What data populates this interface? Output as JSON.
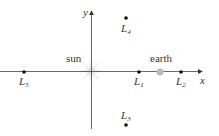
{
  "diagram": {
    "axes": {
      "x_label": "x",
      "y_label": "y"
    },
    "bodies": {
      "sun": {
        "label": "sun",
        "color": "#d8d8d8"
      },
      "earth": {
        "label": "earth",
        "color": "#b8b8b8"
      }
    },
    "points": [
      {
        "id": "L1",
        "base": "L",
        "sub": "1"
      },
      {
        "id": "L2",
        "base": "L",
        "sub": "2"
      },
      {
        "id": "L3",
        "base": "L",
        "sub": "3"
      },
      {
        "id": "L4",
        "base": "L",
        "sub": "4"
      },
      {
        "id": "L5",
        "base": "L",
        "sub": "5"
      }
    ]
  }
}
